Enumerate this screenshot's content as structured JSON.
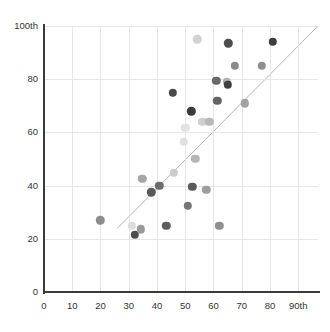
{
  "chart_data": {
    "type": "scatter",
    "title": "",
    "xlabel": "",
    "ylabel": "",
    "xlim": [
      0,
      97
    ],
    "ylim": [
      0,
      100
    ],
    "grid": true,
    "legend": "none",
    "x_ticks": [
      {
        "value": 0,
        "label": "0"
      },
      {
        "value": 10,
        "label": "10"
      },
      {
        "value": 20,
        "label": "20"
      },
      {
        "value": 30,
        "label": "30"
      },
      {
        "value": 40,
        "label": "40"
      },
      {
        "value": 50,
        "label": "50"
      },
      {
        "value": 60,
        "label": "60"
      },
      {
        "value": 70,
        "label": "70"
      },
      {
        "value": 80,
        "label": "80"
      },
      {
        "value": 90,
        "label": "90th"
      }
    ],
    "y_ticks": [
      {
        "value": 0,
        "label": "0"
      },
      {
        "value": 20,
        "label": "20"
      },
      {
        "value": 40,
        "label": "40"
      },
      {
        "value": 60,
        "label": "60"
      },
      {
        "value": 80,
        "label": "80"
      },
      {
        "value": 100,
        "label": "100th"
      }
    ],
    "x_gridlines": [
      10,
      20,
      30,
      40,
      50,
      60,
      70,
      80,
      90
    ],
    "y_gridlines": [
      20,
      40,
      60,
      80,
      100
    ],
    "reference_line": {
      "name": "diagonal-trend-line",
      "x0": 26.0,
      "y0": 24.0,
      "x1": 97.0,
      "y1": 100.0,
      "color": "#b3b3b3",
      "width": 1
    },
    "axis_color": "#3b3b3b",
    "gridline_color": "#e6e6e6",
    "point_radius": 4.2,
    "points": [
      {
        "x": 20.0,
        "y": 27.0,
        "color": "#8c8c8c"
      },
      {
        "x": 31.0,
        "y": 25.0,
        "color": "#dcdcdc"
      },
      {
        "x": 32.2,
        "y": 21.5,
        "color": "#4d4d4d"
      },
      {
        "x": 34.2,
        "y": 23.5,
        "color": "#9a9a9a"
      },
      {
        "x": 34.8,
        "y": 42.5,
        "color": "#a6a6a6"
      },
      {
        "x": 38.0,
        "y": 37.5,
        "color": "#595959"
      },
      {
        "x": 40.8,
        "y": 40.0,
        "color": "#6e6e6e"
      },
      {
        "x": 43.3,
        "y": 25.0,
        "color": "#5e5e5e"
      },
      {
        "x": 45.5,
        "y": 75.0,
        "color": "#4a4a4a"
      },
      {
        "x": 46.0,
        "y": 44.8,
        "color": "#cccccc"
      },
      {
        "x": 49.5,
        "y": 56.5,
        "color": "#e0e0e0"
      },
      {
        "x": 50.0,
        "y": 61.8,
        "color": "#e2e2e2"
      },
      {
        "x": 51.0,
        "y": 32.5,
        "color": "#757575"
      },
      {
        "x": 52.2,
        "y": 68.0,
        "color": "#3a3a3a"
      },
      {
        "x": 52.5,
        "y": 39.5,
        "color": "#5a5a5a"
      },
      {
        "x": 53.5,
        "y": 50.0,
        "color": "#b5b5b5"
      },
      {
        "x": 54.3,
        "y": 95.0,
        "color": "#d2d2d2"
      },
      {
        "x": 56.0,
        "y": 64.0,
        "color": "#cfcfcf"
      },
      {
        "x": 57.5,
        "y": 38.5,
        "color": "#9e9e9e"
      },
      {
        "x": 58.5,
        "y": 64.0,
        "color": "#b8b8b8"
      },
      {
        "x": 61.0,
        "y": 79.5,
        "color": "#696969"
      },
      {
        "x": 61.3,
        "y": 71.8,
        "color": "#636363"
      },
      {
        "x": 62.0,
        "y": 25.0,
        "color": "#8f8f8f"
      },
      {
        "x": 64.8,
        "y": 79.0,
        "color": "#b0b0b0"
      },
      {
        "x": 65.0,
        "y": 77.8,
        "color": "#3f3f3f"
      },
      {
        "x": 65.2,
        "y": 93.5,
        "color": "#4c4c4c"
      },
      {
        "x": 67.5,
        "y": 85.0,
        "color": "#8a8a8a"
      },
      {
        "x": 71.0,
        "y": 71.0,
        "color": "#a3a3a3"
      },
      {
        "x": 77.0,
        "y": 85.0,
        "color": "#8f8f8f"
      },
      {
        "x": 81.0,
        "y": 94.0,
        "color": "#3d3d3d"
      }
    ]
  }
}
